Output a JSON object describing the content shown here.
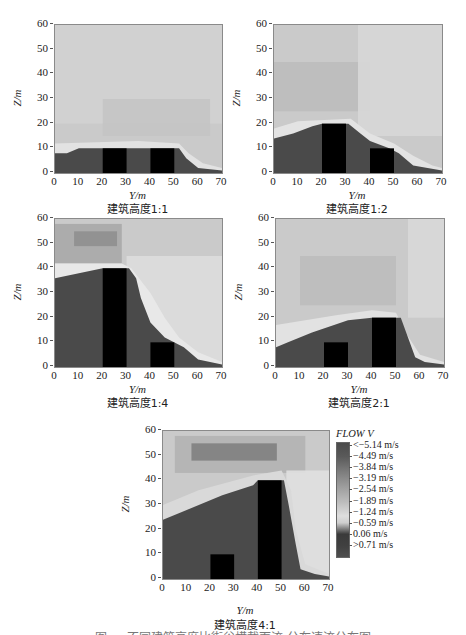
{
  "figure": {
    "caption_partial": "图 … 不同建筑高度比街谷横截面流  分布速流分布图",
    "legend": {
      "title": "FLOW V",
      "labels": [
        "<−5.14 m/s",
        "−4.49 m/s",
        "−3.84 m/s",
        "−3.19 m/s",
        "−2.54 m/s",
        "−1.89 m/s",
        "−1.24 m/s",
        "−0.59 m/s",
        "0.06 m/s",
        ">0.71 m/s"
      ],
      "colors": [
        "#4a4a4a",
        "#5e5e5e",
        "#7a7a7a",
        "#979797",
        "#b3b3b3",
        "#cfcfcf",
        "#dcdcdc",
        "#3a3a3a",
        "#444444",
        "#505050"
      ]
    }
  },
  "chart_data": [
    {
      "type": "heatmap",
      "title": "建筑高度1:1",
      "xlabel": "Y/m",
      "ylabel": "Z/m",
      "xlim": [
        0,
        70
      ],
      "ylim": [
        0,
        60
      ],
      "xticks": [
        0,
        10,
        20,
        30,
        40,
        50,
        60,
        70
      ],
      "yticks": [
        0,
        10,
        20,
        30,
        40,
        50,
        60
      ],
      "buildings": [
        {
          "x0": 20,
          "x1": 30,
          "height": 10
        },
        {
          "x0": 40,
          "x1": 50,
          "height": 10
        }
      ],
      "colorbar": "FLOW V (m/s)",
      "description": "Low-velocity dark recirculation zone below ~10 m across street canyon; light shear layer at 10-12 m; uniform light-gray free stream above."
    },
    {
      "type": "heatmap",
      "title": "建筑高度1:2",
      "xlabel": "Y/m",
      "ylabel": "Z/m",
      "xlim": [
        0,
        70
      ],
      "ylim": [
        0,
        60
      ],
      "xticks": [
        0,
        10,
        20,
        30,
        40,
        50,
        60,
        70
      ],
      "yticks": [
        0,
        10,
        20,
        30,
        40,
        50,
        60
      ],
      "buildings": [
        {
          "x0": 20,
          "x1": 30,
          "height": 20
        },
        {
          "x0": 40,
          "x1": 50,
          "height": 10
        }
      ],
      "colorbar": "FLOW V (m/s)",
      "description": "Dark wake region rises to ~20 m upstream and over the taller building, stepping down behind the lower one."
    },
    {
      "type": "heatmap",
      "title": "建筑高度1:4",
      "xlabel": "Y/m",
      "ylabel": "Z/m",
      "xlim": [
        0,
        70
      ],
      "ylim": [
        0,
        60
      ],
      "xticks": [
        0,
        10,
        20,
        30,
        40,
        50,
        60,
        70
      ],
      "yticks": [
        0,
        10,
        20,
        30,
        40,
        50,
        60
      ],
      "buildings": [
        {
          "x0": 20,
          "x1": 30,
          "height": 40
        },
        {
          "x0": 40,
          "x1": 50,
          "height": 10
        }
      ],
      "colorbar": "FLOW V (m/s)",
      "description": "Dark region fills up to ~40 m upstream of the 40 m building, descending diagonally downstream; darker band at ~50-55 m above upstream area."
    },
    {
      "type": "heatmap",
      "title": "建筑高度2:1",
      "xlabel": "Y/m",
      "ylabel": "Z/m",
      "xlim": [
        0,
        70
      ],
      "ylim": [
        0,
        60
      ],
      "xticks": [
        0,
        10,
        20,
        30,
        40,
        50,
        60,
        70
      ],
      "yticks": [
        0,
        10,
        20,
        30,
        40,
        50,
        60
      ],
      "buildings": [
        {
          "x0": 20,
          "x1": 30,
          "height": 10
        },
        {
          "x0": 40,
          "x1": 50,
          "height": 20
        }
      ],
      "colorbar": "FLOW V (m/s)",
      "description": "Dark zone rises from ~10 m upstream to ~20 m at the taller downstream building; light wake behind."
    },
    {
      "type": "heatmap",
      "title": "建筑高度4:1",
      "xlabel": "Y/m",
      "ylabel": "Z/m",
      "xlim": [
        0,
        70
      ],
      "ylim": [
        0,
        60
      ],
      "xticks": [
        0,
        10,
        20,
        30,
        40,
        50,
        60,
        70
      ],
      "yticks": [
        0,
        10,
        20,
        30,
        40,
        50,
        60
      ],
      "buildings": [
        {
          "x0": 20,
          "x1": 30,
          "height": 10
        },
        {
          "x0": 40,
          "x1": 50,
          "height": 40
        }
      ],
      "colorbar": "FLOW V (m/s)",
      "colorbar_ticks": [
        "<-5.14",
        "-4.49",
        "-3.84",
        "-3.19",
        "-2.54",
        "-1.89",
        "-1.24",
        "-0.59",
        "0.06",
        ">0.71"
      ],
      "description": "Dark region climbs from ~25 m at Y=0 to ~40 m at the tall downstream building; dark band near 50-55 m; light zone downstream."
    }
  ]
}
